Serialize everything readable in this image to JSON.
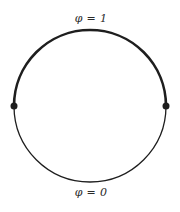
{
  "diagram": {
    "top_label": "φ = 1",
    "bottom_label": "φ = 0",
    "circle": {
      "cx": 90,
      "cy": 106,
      "r": 76,
      "upper_arc_stroke_width": 2.6,
      "lower_arc_stroke_width": 1.3,
      "stroke_color": "#1e1e1e"
    },
    "points": [
      {
        "name": "left-junction-point",
        "x": 14,
        "y": 106
      },
      {
        "name": "right-junction-point",
        "x": 166,
        "y": 106
      }
    ],
    "point_radius": 3.5,
    "point_color": "#1e1e1e"
  }
}
